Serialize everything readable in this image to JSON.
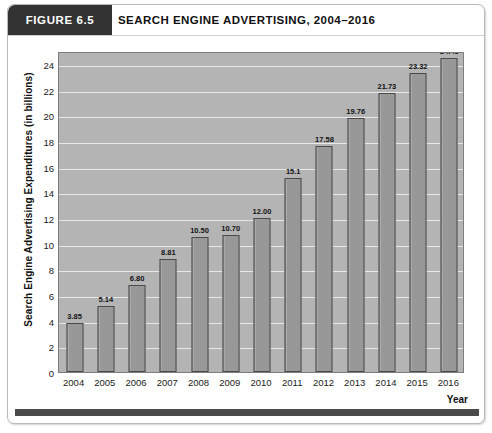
{
  "figure": {
    "tab_label": "FIGURE 6.5",
    "title": "SEARCH ENGINE ADVERTISING, 2004–2016"
  },
  "colors": {
    "tab_background": "#333333",
    "plot_background": "#b4b4b4",
    "bar_fill": "#989898",
    "bar_edge": "#4a4a4a",
    "gridline": "#e8e8e8",
    "accent_bar": "#4a4a4a",
    "text": "#111111"
  },
  "chart_data": {
    "type": "bar",
    "title": "SEARCH ENGINE ADVERTISING, 2004–2016",
    "xlabel": "Year",
    "ylabel": "Search Engine Advertising Expenditures (in billions)",
    "categories": [
      "2004",
      "2005",
      "2006",
      "2007",
      "2008",
      "2009",
      "2010",
      "2011",
      "2012",
      "2013",
      "2014",
      "2015",
      "2016"
    ],
    "values": [
      3.85,
      5.14,
      6.8,
      8.81,
      10.5,
      10.7,
      12.0,
      15.1,
      17.58,
      19.76,
      21.73,
      23.32,
      24.45
    ],
    "value_labels": [
      "3.85",
      "5.14",
      "6.80",
      "8.81",
      "10.50",
      "10.70",
      "12.00",
      "15.1",
      "17.58",
      "19.76",
      "21.73",
      "23.32",
      "24.45"
    ],
    "ylim": [
      0,
      25
    ],
    "yticks": [
      0,
      2,
      4,
      6,
      8,
      10,
      12,
      14,
      16,
      18,
      20,
      22,
      24
    ],
    "ytick_labels": [
      "0",
      "2",
      "4",
      "6",
      "8",
      "10",
      "12",
      "14",
      "16",
      "18",
      "20",
      "22",
      "24"
    ],
    "grid": true,
    "legend": false
  }
}
